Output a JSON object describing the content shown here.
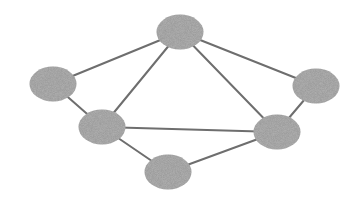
{
  "diagram": {
    "type": "undirected-graph",
    "width": 361,
    "height": 201,
    "background": "#ffffff",
    "node_fill": "#b4b4b4",
    "node_texture": "#a2a2a2",
    "edge_color": "#6e6e6e",
    "edge_width": 2,
    "nodes": [
      {
        "id": "top",
        "cx": 180,
        "cy": 32,
        "rx": 23.5,
        "ry": 17.5
      },
      {
        "id": "left",
        "cx": 53,
        "cy": 84,
        "rx": 23.5,
        "ry": 17.5
      },
      {
        "id": "mid-left",
        "cx": 102,
        "cy": 127,
        "rx": 23.5,
        "ry": 17.5
      },
      {
        "id": "bottom",
        "cx": 168,
        "cy": 172,
        "rx": 23.5,
        "ry": 17.5
      },
      {
        "id": "right-mid",
        "cx": 277,
        "cy": 132,
        "rx": 23.5,
        "ry": 17.5
      },
      {
        "id": "right",
        "cx": 316,
        "cy": 86,
        "rx": 23.5,
        "ry": 17.5
      }
    ],
    "edges": [
      {
        "from": "top",
        "to": "left"
      },
      {
        "from": "top",
        "to": "mid-left"
      },
      {
        "from": "top",
        "to": "right-mid"
      },
      {
        "from": "top",
        "to": "right"
      },
      {
        "from": "left",
        "to": "mid-left"
      },
      {
        "from": "mid-left",
        "to": "right-mid"
      },
      {
        "from": "mid-left",
        "to": "bottom"
      },
      {
        "from": "bottom",
        "to": "right-mid"
      },
      {
        "from": "right",
        "to": "right-mid"
      }
    ]
  }
}
